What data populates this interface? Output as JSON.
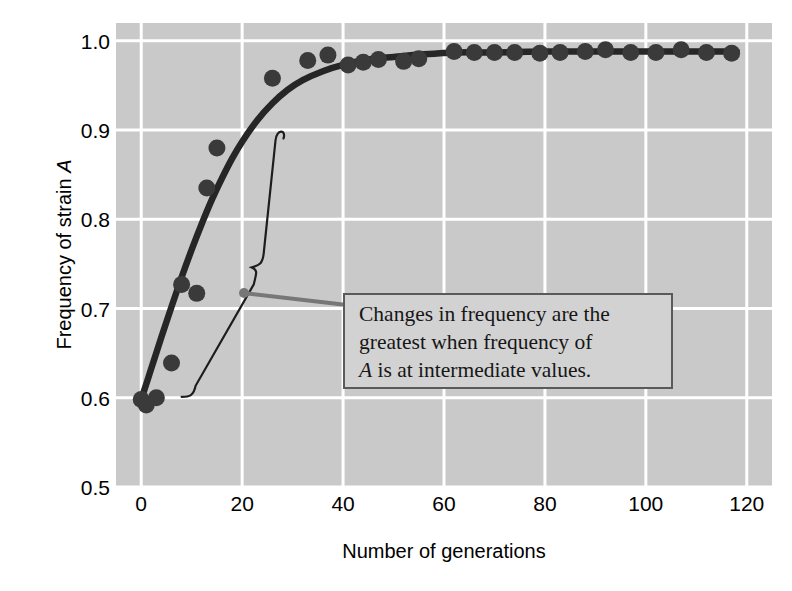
{
  "chart_data": {
    "type": "scatter",
    "title": "",
    "xlabel": "Number of generations",
    "ylabel": "Frequency of strain A",
    "ylabel_plain": "Frequency of strain ",
    "ylabel_italic": "A",
    "xlim": [
      -5,
      125
    ],
    "ylim": [
      0.5,
      1.02
    ],
    "xticks": [
      0,
      20,
      40,
      60,
      80,
      100,
      120
    ],
    "xticklabels": [
      "0",
      "20",
      "40",
      "60",
      "80",
      "100",
      "120"
    ],
    "yticks": [
      0.5,
      0.6,
      0.7,
      0.8,
      0.9,
      1.0
    ],
    "yticklabels": [
      "0.5",
      "0.6",
      "0.7",
      "0.8",
      "0.9",
      "1.0"
    ],
    "grid": true,
    "grid_color": "#ffffff",
    "plot_background": "#c9c9c9",
    "legend": "none",
    "point_color": "#3a3a3a",
    "line_color": "#262626",
    "points": [
      {
        "x": 0,
        "y": 0.598
      },
      {
        "x": 1,
        "y": 0.592
      },
      {
        "x": 3,
        "y": 0.6
      },
      {
        "x": 6,
        "y": 0.639
      },
      {
        "x": 8,
        "y": 0.727
      },
      {
        "x": 11,
        "y": 0.717
      },
      {
        "x": 13,
        "y": 0.835
      },
      {
        "x": 15,
        "y": 0.88
      },
      {
        "x": 26,
        "y": 0.958
      },
      {
        "x": 33,
        "y": 0.978
      },
      {
        "x": 37,
        "y": 0.984
      },
      {
        "x": 41,
        "y": 0.973
      },
      {
        "x": 44,
        "y": 0.976
      },
      {
        "x": 47,
        "y": 0.979
      },
      {
        "x": 52,
        "y": 0.977
      },
      {
        "x": 55,
        "y": 0.98
      },
      {
        "x": 62,
        "y": 0.988
      },
      {
        "x": 66,
        "y": 0.987
      },
      {
        "x": 70,
        "y": 0.987
      },
      {
        "x": 74,
        "y": 0.987
      },
      {
        "x": 79,
        "y": 0.986
      },
      {
        "x": 83,
        "y": 0.987
      },
      {
        "x": 88,
        "y": 0.988
      },
      {
        "x": 92,
        "y": 0.99
      },
      {
        "x": 97,
        "y": 0.987
      },
      {
        "x": 102,
        "y": 0.987
      },
      {
        "x": 107,
        "y": 0.99
      },
      {
        "x": 112,
        "y": 0.987
      },
      {
        "x": 117,
        "y": 0.986
      }
    ],
    "fitted_curve": [
      {
        "x": 0,
        "y": 0.598
      },
      {
        "x": 2,
        "y": 0.633
      },
      {
        "x": 4,
        "y": 0.668
      },
      {
        "x": 6,
        "y": 0.702
      },
      {
        "x": 8,
        "y": 0.735
      },
      {
        "x": 10,
        "y": 0.766
      },
      {
        "x": 12,
        "y": 0.795
      },
      {
        "x": 14,
        "y": 0.822
      },
      {
        "x": 16,
        "y": 0.846
      },
      {
        "x": 18,
        "y": 0.868
      },
      {
        "x": 20,
        "y": 0.887
      },
      {
        "x": 23,
        "y": 0.911
      },
      {
        "x": 26,
        "y": 0.93
      },
      {
        "x": 29,
        "y": 0.945
      },
      {
        "x": 32,
        "y": 0.956
      },
      {
        "x": 36,
        "y": 0.966
      },
      {
        "x": 40,
        "y": 0.973
      },
      {
        "x": 45,
        "y": 0.979
      },
      {
        "x": 50,
        "y": 0.982
      },
      {
        "x": 56,
        "y": 0.985
      },
      {
        "x": 63,
        "y": 0.987
      },
      {
        "x": 70,
        "y": 0.987
      },
      {
        "x": 80,
        "y": 0.988
      },
      {
        "x": 90,
        "y": 0.988
      },
      {
        "x": 100,
        "y": 0.988
      },
      {
        "x": 110,
        "y": 0.988
      },
      {
        "x": 118,
        "y": 0.988
      }
    ],
    "annotation": {
      "text_lines": [
        "Changes in frequency are the",
        "greatest when frequency of",
        "A is at intermediate values."
      ],
      "line3_italic_prefix": "A",
      "line3_rest": " is at intermediate values.",
      "box_background": "#d2d2d2",
      "box_border": "#5a5a5a",
      "brace_note": "curly brace spanning steep-rise region of the curve",
      "brace_x_range": [
        13,
        27
      ],
      "brace_y_range": [
        0.6,
        0.895
      ]
    }
  }
}
